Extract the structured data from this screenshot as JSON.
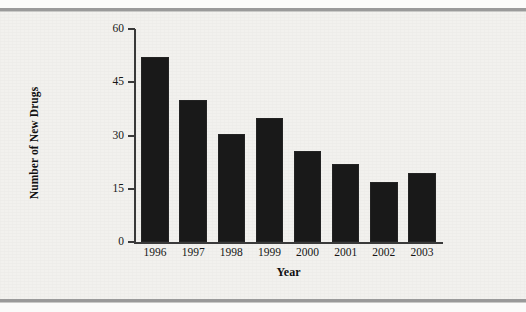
{
  "figure": {
    "background_color": "#f2f1ee",
    "rule_color": "#9a9a9a",
    "bar_color": "#191919",
    "axis_color": "#3a3a3a"
  },
  "chart_data": {
    "type": "bar",
    "title": "",
    "subtitle": "",
    "xlabel": "Year",
    "ylabel": "Number of New Drugs",
    "categories": [
      "1996",
      "1997",
      "1998",
      "1999",
      "2000",
      "2001",
      "2002",
      "2003"
    ],
    "values": [
      52,
      40,
      30.5,
      35,
      25.5,
      22,
      17,
      19.5
    ],
    "ylim": [
      0,
      60
    ],
    "yticks": [
      0,
      15,
      30,
      45,
      60
    ],
    "ytick_labels": [
      "0",
      "15",
      "30",
      "45",
      "60"
    ],
    "grid": false,
    "legend": false,
    "legend_position": "none",
    "series": [
      {
        "name": "Number of New Drugs",
        "values": [
          52,
          40,
          30.5,
          35,
          25.5,
          22,
          17,
          19.5
        ]
      }
    ],
    "annotations": []
  }
}
